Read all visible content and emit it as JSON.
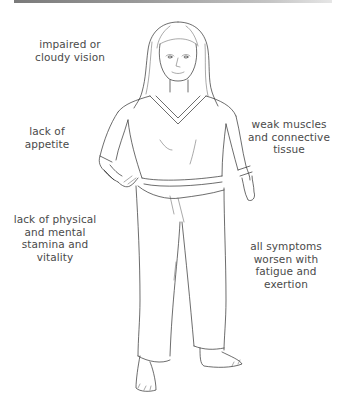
{
  "illustration": {
    "subject": "standing woman figure, line drawing",
    "top_bar_color": "#8a8a8a",
    "label_color": "#4a4a4a",
    "line_color": "#2e2e2e"
  },
  "labels": {
    "vision": "impaired or\ncloudy vision",
    "appetite": "lack of\nappetite",
    "stamina": "lack of physical\nand mental\nstamina and\nvitality",
    "muscles": "weak muscles\nand connective\ntissue",
    "fatigue": "all symptoms\nworsen with\nfatigue and\nexertion"
  }
}
